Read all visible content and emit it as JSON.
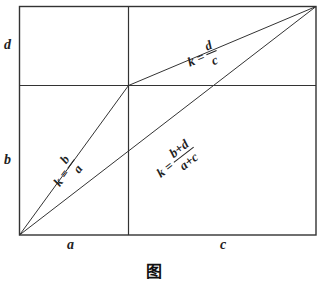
{
  "figure": {
    "type": "rectangle-slope-diagram",
    "labels": {
      "left_top": "d",
      "left_bottom": "b",
      "bottom_left": "a",
      "bottom_right": "c"
    },
    "formulas": {
      "upper": {
        "prefix": "k =",
        "numerator": "d",
        "denominator": "c"
      },
      "left": {
        "prefix": "k =",
        "numerator": "b",
        "denominator": "a"
      },
      "diagonal": {
        "prefix": "k =",
        "numerator": "b+d",
        "denominator": "a+c"
      }
    },
    "caption": "图 "
  }
}
